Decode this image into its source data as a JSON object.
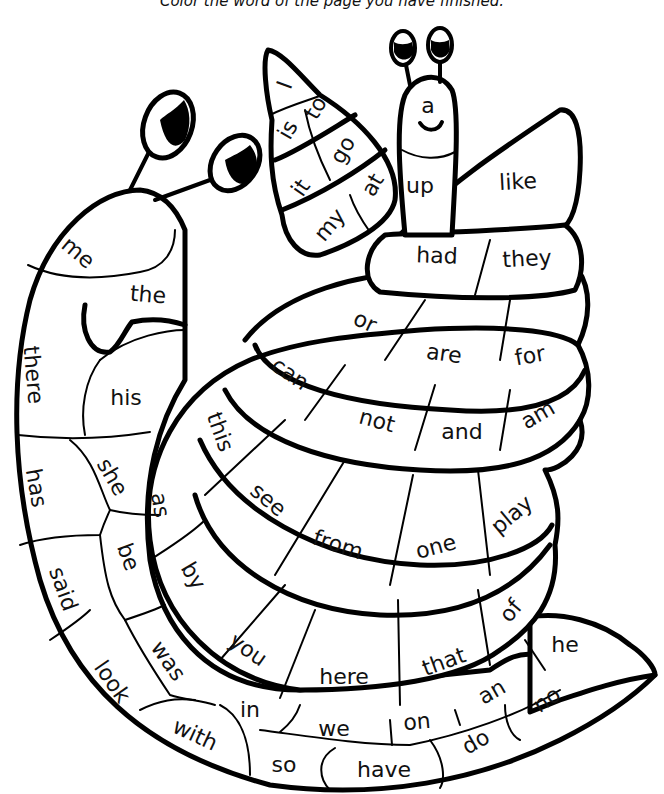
{
  "instruction": "Color the word of the page you have finished.",
  "colors": {
    "line": "#000000",
    "background": "#ffffff",
    "text": "#111111"
  },
  "words": [
    {
      "id": "I",
      "text": "I",
      "x": 285,
      "y": 85,
      "r": -70
    },
    {
      "id": "is",
      "text": "is",
      "x": 288,
      "y": 130,
      "r": -60
    },
    {
      "id": "to",
      "text": "to",
      "x": 316,
      "y": 108,
      "r": -60
    },
    {
      "id": "go",
      "text": "go",
      "x": 343,
      "y": 150,
      "r": -60
    },
    {
      "id": "it",
      "text": "it",
      "x": 301,
      "y": 188,
      "r": -55
    },
    {
      "id": "at",
      "text": "at",
      "x": 373,
      "y": 185,
      "r": -60
    },
    {
      "id": "my",
      "text": "my",
      "x": 330,
      "y": 225,
      "r": -50
    },
    {
      "id": "a",
      "text": "a",
      "x": 428,
      "y": 106,
      "r": 0
    },
    {
      "id": "up",
      "text": "up",
      "x": 420,
      "y": 186,
      "r": 0
    },
    {
      "id": "like",
      "text": "like",
      "x": 518,
      "y": 182,
      "r": -3
    },
    {
      "id": "had",
      "text": "had",
      "x": 437,
      "y": 256,
      "r": 2
    },
    {
      "id": "they",
      "text": "they",
      "x": 527,
      "y": 259,
      "r": -3
    },
    {
      "id": "me",
      "text": "me",
      "x": 78,
      "y": 253,
      "r": 40
    },
    {
      "id": "the",
      "text": "the",
      "x": 148,
      "y": 295,
      "r": 5
    },
    {
      "id": "or",
      "text": "or",
      "x": 365,
      "y": 322,
      "r": 25
    },
    {
      "id": "are",
      "text": "are",
      "x": 444,
      "y": 354,
      "r": 8
    },
    {
      "id": "for",
      "text": "for",
      "x": 530,
      "y": 356,
      "r": -10
    },
    {
      "id": "can",
      "text": "can",
      "x": 290,
      "y": 374,
      "r": 35
    },
    {
      "id": "there",
      "text": "there",
      "x": 33,
      "y": 375,
      "r": 85
    },
    {
      "id": "his",
      "text": "his",
      "x": 126,
      "y": 398,
      "r": 0
    },
    {
      "id": "not",
      "text": "not",
      "x": 377,
      "y": 421,
      "r": 15
    },
    {
      "id": "and",
      "text": "and",
      "x": 462,
      "y": 432,
      "r": 0
    },
    {
      "id": "am",
      "text": "am",
      "x": 538,
      "y": 415,
      "r": -30
    },
    {
      "id": "this",
      "text": "this",
      "x": 220,
      "y": 432,
      "r": 70
    },
    {
      "id": "has",
      "text": "has",
      "x": 36,
      "y": 488,
      "r": 80
    },
    {
      "id": "she",
      "text": "she",
      "x": 112,
      "y": 477,
      "r": 60
    },
    {
      "id": "as",
      "text": "as",
      "x": 160,
      "y": 505,
      "r": 80
    },
    {
      "id": "see",
      "text": "see",
      "x": 268,
      "y": 500,
      "r": 40
    },
    {
      "id": "from",
      "text": "from",
      "x": 338,
      "y": 545,
      "r": 18
    },
    {
      "id": "one",
      "text": "one",
      "x": 436,
      "y": 547,
      "r": -15
    },
    {
      "id": "play",
      "text": "play",
      "x": 512,
      "y": 515,
      "r": -40
    },
    {
      "id": "said",
      "text": "said",
      "x": 63,
      "y": 589,
      "r": 70
    },
    {
      "id": "be",
      "text": "be",
      "x": 128,
      "y": 557,
      "r": 70
    },
    {
      "id": "by",
      "text": "by",
      "x": 193,
      "y": 576,
      "r": 60
    },
    {
      "id": "of",
      "text": "of",
      "x": 511,
      "y": 611,
      "r": -50
    },
    {
      "id": "you",
      "text": "you",
      "x": 248,
      "y": 650,
      "r": 35
    },
    {
      "id": "was",
      "text": "was",
      "x": 168,
      "y": 661,
      "r": 55
    },
    {
      "id": "look",
      "text": "look",
      "x": 112,
      "y": 682,
      "r": 55
    },
    {
      "id": "here",
      "text": "here",
      "x": 344,
      "y": 677,
      "r": 0
    },
    {
      "id": "that",
      "text": "that",
      "x": 444,
      "y": 662,
      "r": -20
    },
    {
      "id": "he",
      "text": "he",
      "x": 565,
      "y": 645,
      "r": 0
    },
    {
      "id": "in",
      "text": "in",
      "x": 250,
      "y": 710,
      "r": 0
    },
    {
      "id": "an",
      "text": "an",
      "x": 492,
      "y": 692,
      "r": -30
    },
    {
      "id": "no",
      "text": "no",
      "x": 547,
      "y": 700,
      "r": -35
    },
    {
      "id": "with",
      "text": "with",
      "x": 195,
      "y": 735,
      "r": 25
    },
    {
      "id": "we",
      "text": "we",
      "x": 334,
      "y": 729,
      "r": 0
    },
    {
      "id": "on",
      "text": "on",
      "x": 417,
      "y": 722,
      "r": -5
    },
    {
      "id": "do",
      "text": "do",
      "x": 476,
      "y": 742,
      "r": -30
    },
    {
      "id": "so",
      "text": "so",
      "x": 284,
      "y": 765,
      "r": 0
    },
    {
      "id": "have",
      "text": "have",
      "x": 384,
      "y": 770,
      "r": 0
    }
  ]
}
